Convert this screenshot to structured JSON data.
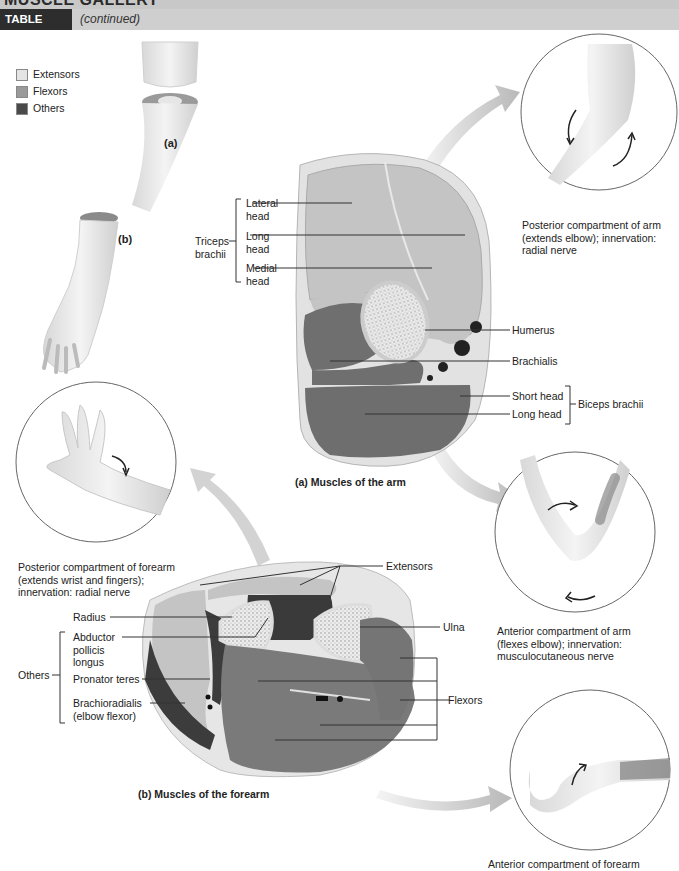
{
  "header": {
    "gallery_title": "MUSCLE GALLERY",
    "table_label": "TABLE 10.12",
    "continued": "(continued)"
  },
  "legend": {
    "items": [
      {
        "label": "Extensors",
        "color": "#e4e4e4"
      },
      {
        "label": "Flexors",
        "color": "#9a9a9a"
      },
      {
        "label": "Others",
        "color": "#4a4a4a"
      }
    ]
  },
  "overview": {
    "panel_a": "(a)",
    "panel_b": "(b)"
  },
  "arm_section": {
    "caption": "(a) Muscles of the arm",
    "triceps_group": "Triceps brachii",
    "triceps_heads": [
      "Lateral head",
      "Long head",
      "Medial head"
    ],
    "humerus": "Humerus",
    "brachialis": "Brachialis",
    "biceps_group": "Biceps brachii",
    "biceps_heads": [
      "Short head",
      "Long head"
    ]
  },
  "forearm_section": {
    "caption": "(b) Muscles of the forearm",
    "extensors": "Extensors",
    "radius": "Radius",
    "ulna": "Ulna",
    "flexors": "Flexors",
    "others_group": "Others",
    "others_items": [
      "Abductor pollicis longus",
      "Pronator teres",
      "Brachioradialis (elbow flexor)"
    ]
  },
  "callouts": {
    "posterior_arm": "Posterior compartment of arm (extends elbow); innervation: radial nerve",
    "anterior_arm": "Anterior compartment of arm (flexes elbow); innervation: musculocutaneous nerve",
    "posterior_forearm": "Posterior compartment of forearm (extends wrist and fingers); innervation: radial nerve",
    "anterior_forearm": "Anterior compartment of forearm"
  },
  "colors": {
    "extensor": "#c6c6c6",
    "flexor": "#7a7a7a",
    "other": "#3c3c3c",
    "bone": "#f2f2f2",
    "tag_bg": "#2d2d2d",
    "header_bg": "#cfcfcf"
  }
}
